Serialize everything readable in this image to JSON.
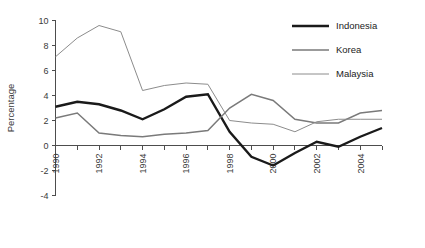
{
  "chart_data": {
    "type": "line",
    "title": "",
    "xlabel": "",
    "ylabel": "Percentage",
    "xlim": [
      1990,
      2005
    ],
    "ylim": [
      -4,
      10
    ],
    "ytick_step": 2,
    "grid": false,
    "legend_position": "top-right",
    "x": [
      1990,
      1991,
      1992,
      1993,
      1994,
      1995,
      1996,
      1997,
      1998,
      1999,
      2000,
      2001,
      2002,
      2003,
      2004,
      2005
    ],
    "xticks": [
      1990,
      1991,
      1992,
      1993,
      1994,
      1995,
      1996,
      1997,
      1998,
      1999,
      2000,
      2001,
      2002,
      2003,
      2004,
      2005
    ],
    "xtick_labels": [
      "1990",
      "",
      "1992",
      "",
      "1994",
      "",
      "1996",
      "",
      "1998",
      "",
      "2000",
      "",
      "2002",
      "",
      "2004",
      ""
    ],
    "yticks": [
      -4,
      -2,
      0,
      2,
      4,
      6,
      8,
      10
    ],
    "ytick_labels": [
      "-4",
      "-2",
      "0",
      "2",
      "4",
      "6",
      "8",
      "10"
    ],
    "series": [
      {
        "name": "Indonesia",
        "color": "#1a1a1a",
        "width": 2.4,
        "values": [
          3.1,
          3.5,
          3.3,
          2.8,
          2.1,
          2.9,
          3.9,
          4.1,
          1.1,
          -0.9,
          -1.6,
          -0.6,
          0.3,
          -0.1,
          0.7,
          1.4
        ]
      },
      {
        "name": "Korea",
        "color": "#7a7a7a",
        "width": 1.5,
        "values": [
          2.2,
          2.6,
          1.0,
          0.8,
          0.7,
          0.9,
          1.0,
          1.2,
          3.0,
          4.1,
          3.6,
          2.1,
          1.8,
          1.8,
          2.6,
          2.8
        ]
      },
      {
        "name": "Malaysia",
        "color": "#8c8c8c",
        "width": 1.0,
        "values": [
          7.1,
          8.6,
          9.6,
          9.1,
          4.4,
          4.8,
          5.0,
          4.9,
          2.0,
          1.8,
          1.7,
          1.1,
          1.9,
          2.1,
          2.1,
          2.1
        ]
      }
    ]
  },
  "legend": {
    "entries": [
      {
        "label": "Indonesia"
      },
      {
        "label": "Korea"
      },
      {
        "label": "Malaysia"
      }
    ]
  },
  "axis": {
    "y_title": "Percentage"
  }
}
